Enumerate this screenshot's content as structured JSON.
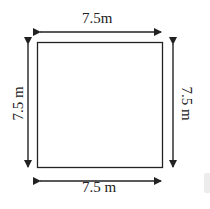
{
  "diagram": {
    "shape": "square",
    "labels": {
      "top": "7.5m",
      "bottom": "7.5 m",
      "left": "7.5 m",
      "right": "7.5 m"
    },
    "colors": {
      "stroke": "#222222",
      "background": "#ffffff"
    }
  }
}
